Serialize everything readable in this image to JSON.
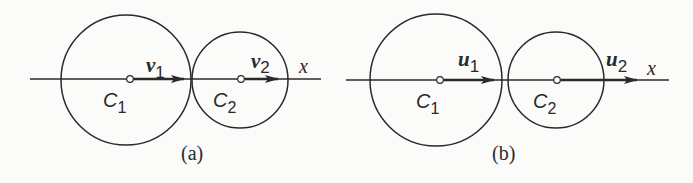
{
  "figure": {
    "panels": [
      {
        "caption": "(a)",
        "axis_label": "x",
        "body1": {
          "label": "C",
          "sub": "1",
          "vector": "v",
          "vector_sub": "1"
        },
        "body2": {
          "label": "C",
          "sub": "2",
          "vector": "v",
          "vector_sub": "2"
        }
      },
      {
        "caption": "(b)",
        "axis_label": "x",
        "body1": {
          "label": "C",
          "sub": "1",
          "vector": "u",
          "vector_sub": "1"
        },
        "body2": {
          "label": "C",
          "sub": "2",
          "vector": "u",
          "vector_sub": "2"
        }
      }
    ],
    "colors": {
      "stroke": "#2a2a2a",
      "background": "#fbfbfa"
    }
  }
}
